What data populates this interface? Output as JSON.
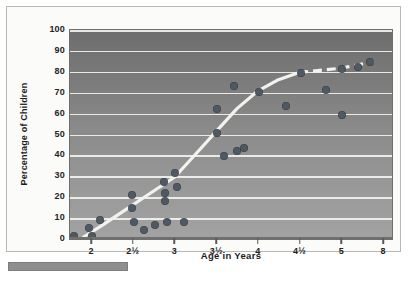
{
  "chart_data": {
    "type": "scatter",
    "title": "",
    "xlabel": "Age in Years",
    "ylabel": "Percentage of Children",
    "ylim": [
      0,
      100
    ],
    "ytick_step": 10,
    "ytick_labels": [
      "0",
      "10",
      "20",
      "30",
      "40",
      "50",
      "60",
      "70",
      "80",
      "90",
      "100"
    ],
    "xtick_labels": [
      "2",
      "2½",
      "3",
      "3½",
      "4",
      "4½",
      "5",
      "8"
    ],
    "xtick_note": "axis is category-spaced; interval from 5 to 8 is compressed",
    "grid": "horizontal white gridlines every 10 units",
    "legend": "none",
    "marker_color": "#4f5964",
    "curve_color": "#f2f2ee",
    "background": "vertical gray gradient, dark at top to light at bottom",
    "points": [
      {
        "age": 1.78,
        "pct": 1.5
      },
      {
        "age": 1.97,
        "pct": 5.5
      },
      {
        "age": 2.0,
        "pct": 1.5
      },
      {
        "age": 2.1,
        "pct": 9.0
      },
      {
        "age": 2.48,
        "pct": 21.0
      },
      {
        "age": 2.48,
        "pct": 15.0
      },
      {
        "age": 2.5,
        "pct": 8.0
      },
      {
        "age": 2.62,
        "pct": 4.5
      },
      {
        "age": 2.76,
        "pct": 6.5
      },
      {
        "age": 2.86,
        "pct": 27.5
      },
      {
        "age": 2.87,
        "pct": 22.0
      },
      {
        "age": 2.88,
        "pct": 18.0
      },
      {
        "age": 2.9,
        "pct": 8.0
      },
      {
        "age": 3.0,
        "pct": 31.5
      },
      {
        "age": 3.02,
        "pct": 25.0
      },
      {
        "age": 3.1,
        "pct": 8.0
      },
      {
        "age": 3.5,
        "pct": 62.0
      },
      {
        "age": 3.5,
        "pct": 50.5
      },
      {
        "age": 3.58,
        "pct": 39.5
      },
      {
        "age": 3.7,
        "pct": 73.0
      },
      {
        "age": 3.74,
        "pct": 42.0
      },
      {
        "age": 3.82,
        "pct": 43.5
      },
      {
        "age": 4.0,
        "pct": 70.5
      },
      {
        "age": 4.32,
        "pct": 63.5
      },
      {
        "age": 4.5,
        "pct": 79.5
      },
      {
        "age": 4.8,
        "pct": 71.5
      },
      {
        "age": 5.0,
        "pct": 81.5
      },
      {
        "age": 5.0,
        "pct": 59.5
      },
      {
        "age": 6.1,
        "pct": 82.5
      },
      {
        "age": 7.0,
        "pct": 84.5
      }
    ],
    "curve": {
      "style": "sigmoid fitted trend line; solid up to age 4½ then dashed",
      "solid_points": [
        {
          "age": 1.9,
          "pct": 0.0
        },
        {
          "age": 2.1,
          "pct": 5.0
        },
        {
          "age": 2.4,
          "pct": 13.0
        },
        {
          "age": 2.7,
          "pct": 21.0
        },
        {
          "age": 3.0,
          "pct": 29.0
        },
        {
          "age": 3.25,
          "pct": 40.0
        },
        {
          "age": 3.5,
          "pct": 51.0
        },
        {
          "age": 3.75,
          "pct": 62.0
        },
        {
          "age": 4.0,
          "pct": 70.5
        },
        {
          "age": 4.25,
          "pct": 76.0
        },
        {
          "age": 4.5,
          "pct": 79.5
        }
      ],
      "dashed_points": [
        {
          "age": 4.5,
          "pct": 79.5
        },
        {
          "age": 5.0,
          "pct": 81.5
        },
        {
          "age": 6.1,
          "pct": 83.0
        },
        {
          "age": 7.4,
          "pct": 84.8
        }
      ]
    }
  },
  "axes": {
    "y_title": "Percentage of Children",
    "x_title": "Age in Years",
    "y_ticks": [
      "100",
      "90",
      "80",
      "70",
      "60",
      "50",
      "40",
      "30",
      "20",
      "10",
      "0"
    ],
    "x_ticks": [
      "2",
      "2½",
      "3",
      "3½",
      "4",
      "4½",
      "5",
      "8"
    ]
  }
}
